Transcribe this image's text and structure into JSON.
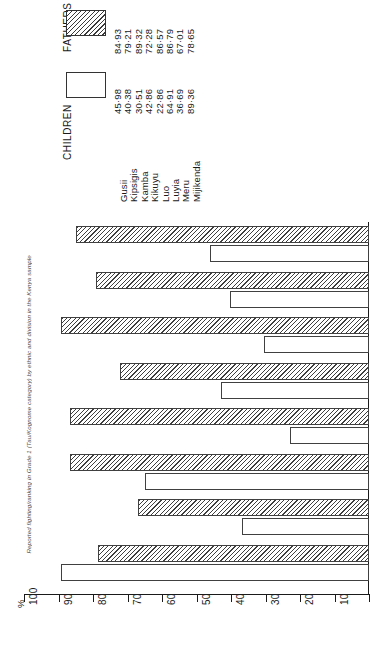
{
  "figure": {
    "title": "Reported fighting/ranking in Grade 1 (Tau/Kognome category) by ethnic and division in the Kenya sample",
    "percent_symbol": "%"
  },
  "legend": {
    "entries": [
      {
        "label": "FATHERS",
        "pattern": "hatched"
      },
      {
        "label": "CHILDREN",
        "pattern": "plain"
      }
    ]
  },
  "chart_data": {
    "type": "bar",
    "orientation": "rotated-horizontal",
    "title": "Reported fighting/ranking in Grade 1 (Tau/Kognome category) by ethnic and division in the Kenya sample",
    "xlabel": "",
    "ylabel": "%",
    "ylim": [
      0,
      100
    ],
    "grid": false,
    "legend_position": "top",
    "tick_labels": [
      "100",
      "90",
      "80",
      "70",
      "60",
      "50",
      "40",
      "30",
      "20",
      "10",
      "0"
    ],
    "tick_values": [
      100,
      90,
      80,
      70,
      60,
      50,
      40,
      30,
      20,
      10,
      0
    ],
    "categories": [
      "Gusii",
      "Kipsigis",
      "Kamba",
      "Kikuyu",
      "Luo",
      "Luyia",
      "Meru",
      "Mijikenda"
    ],
    "series": [
      {
        "name": "FATHERS",
        "pattern": "hatched",
        "values": [
          84.93,
          79.21,
          89.32,
          72.28,
          86.57,
          86.79,
          67.01,
          78.65
        ],
        "labels": [
          "84·93",
          "79·21",
          "89·32",
          "72·28",
          "86·57",
          "86·79",
          "67·01",
          "78·65"
        ]
      },
      {
        "name": "CHILDREN",
        "pattern": "plain",
        "values": [
          45.98,
          40.38,
          30.51,
          42.86,
          22.86,
          64.91,
          36.69,
          89.36
        ],
        "labels": [
          "45·98",
          "40·38",
          "30·51",
          "42·86",
          "22·86",
          "64·91",
          "36·69",
          "89·36"
        ]
      }
    ]
  },
  "colors": {
    "ink": "#1a1a1a",
    "hatch": "#3f3f3f",
    "background": "#ffffff"
  }
}
